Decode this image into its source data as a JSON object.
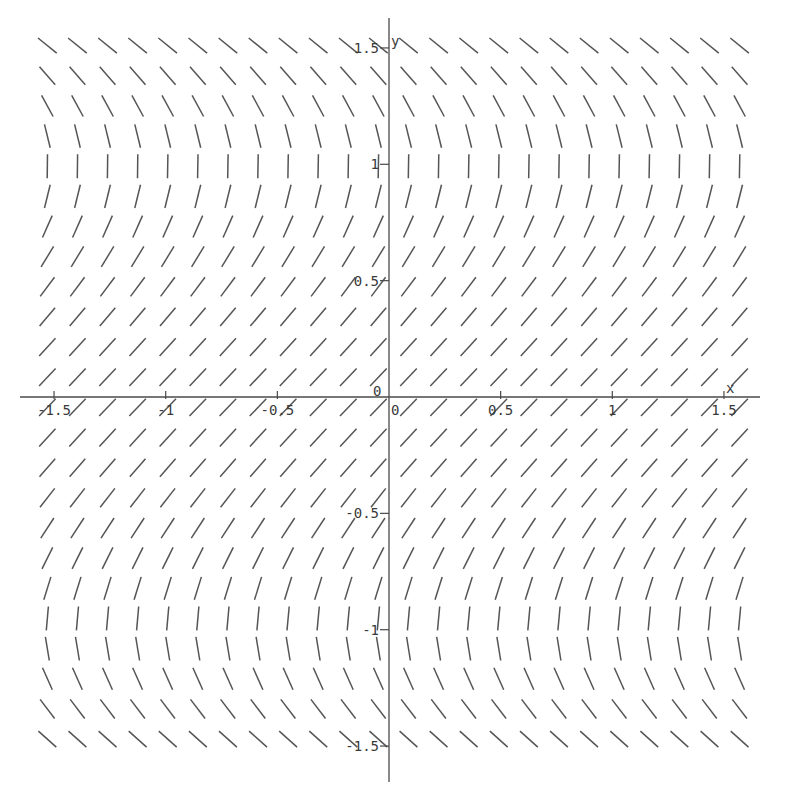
{
  "chart_data": {
    "type": "slope_field",
    "title": "",
    "xlabel": "x",
    "ylabel": "y",
    "equation": "dy/dx = 1/(1 - y^2)",
    "xlim": [
      -1.55,
      1.6
    ],
    "ylim": [
      -1.65,
      1.6
    ],
    "grid": false,
    "legend": null,
    "x_ticks": [
      {
        "value": -1.5,
        "label": "-1.5"
      },
      {
        "value": -1,
        "label": "-1"
      },
      {
        "value": -0.5,
        "label": "-0.5"
      },
      {
        "value": 0,
        "label": "0"
      },
      {
        "value": 0.5,
        "label": "0.5"
      },
      {
        "value": 1,
        "label": "1"
      },
      {
        "value": 1.5,
        "label": "1.5"
      }
    ],
    "y_ticks": [
      {
        "value": 1.5,
        "label": "1.5"
      },
      {
        "value": 1,
        "label": "1"
      },
      {
        "value": 0.5,
        "label": "0.5"
      },
      {
        "value": 0,
        "label": "0"
      },
      {
        "value": -0.5,
        "label": "-0.5"
      },
      {
        "value": -1,
        "label": "-1"
      },
      {
        "value": -1.5,
        "label": "-1.5"
      }
    ],
    "field": {
      "columns": 24,
      "rows": 24,
      "x_range": [
        -1.53,
        1.57
      ],
      "y_range": [
        -1.47,
        1.51
      ],
      "segment_length_px": 24,
      "slope_by_y_note": "slope depends only on y: ~1 at y=0, vertical near y=±1, ~-0.8 at |y|=1.5"
    }
  },
  "styles": {
    "axis_color": "#4a4a4a",
    "segment_color": "#555555",
    "background": "#ffffff"
  },
  "axes": {
    "x_name": "x",
    "y_name": "y",
    "origin_label": "0"
  }
}
